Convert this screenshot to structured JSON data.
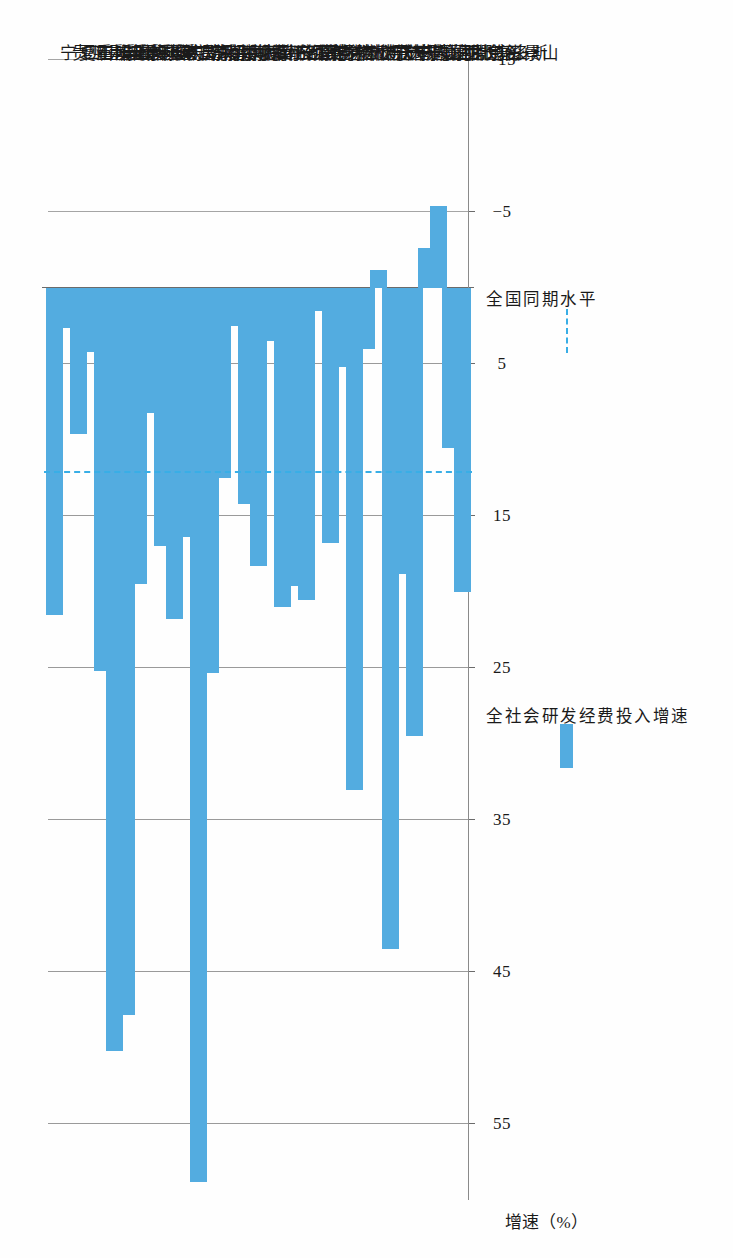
{
  "chart_data": {
    "type": "bar",
    "orientation": "vertical-rotated",
    "title": "",
    "xlabel": "",
    "ylabel": "增速（%）",
    "ylim": [
      -15,
      60
    ],
    "yticks": [
      55,
      45,
      35,
      25,
      15,
      5,
      -5,
      -15
    ],
    "ytick_labels": [
      "55",
      "45",
      "35",
      "25",
      "15",
      "5",
      "-5",
      "-15"
    ],
    "grid": true,
    "bar_color": "#53ACE0",
    "reference_line_color": "#39AEE6",
    "categories": [
      "北京石景山",
      "河北唐山",
      "山西长治",
      "内蒙古包头",
      "内蒙古鄂尔多斯",
      "辽宁沈阳",
      "辽宁鞍山",
      "辽宁抚顺",
      "辽宁大连",
      "吉林长春",
      "吉林吉林",
      "吉林松原",
      "黑龙江大庆",
      "江苏徐州",
      "安徽铜陵",
      "江西萍乡",
      "山东淄博",
      "河南洛阳",
      "河南平顶山",
      "湖北黄石",
      "湖南株洲",
      "湖南湘潭",
      "湖南娄底",
      "广东韶关",
      "重庆永川",
      "重庆涪陵",
      "重庆江津",
      "重庆荣昌",
      "重庆长寿",
      "重庆铜梁",
      "重庆合川",
      "重庆沙坪坝",
      "四川自贡",
      "贵州六盘水",
      "宁夏石嘴山"
    ],
    "series": [
      {
        "name": "全社会研发经费投入增速",
        "values": [
          20.0,
          10.5,
          -5.4,
          -2.6,
          29.5,
          18.8,
          43.5,
          -1.2,
          4.0,
          33.0,
          5.2,
          16.8,
          1.5,
          20.5,
          19.6,
          21.0,
          3.5,
          18.3,
          14.2,
          2.5,
          12.5,
          25.3,
          58.8,
          16.4,
          21.8,
          17.0,
          8.2,
          19.5,
          47.8,
          50.2,
          25.2,
          4.2,
          9.6,
          2.6,
          21.5
        ]
      }
    ],
    "reference_line": {
      "name": "全国同期水平",
      "value": 12.2
    },
    "legend": {
      "position": "bottom-right",
      "entries": [
        {
          "label": "全社会研发经费投入增速",
          "type": "bar",
          "color": "#53ACE0"
        },
        {
          "label": "全国同期水平",
          "type": "dashed-line",
          "color": "#39AEE6"
        }
      ]
    }
  }
}
